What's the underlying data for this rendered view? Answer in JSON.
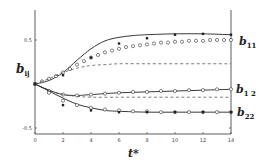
{
  "chart_data": {
    "type": "line",
    "title": "",
    "xlabel": "t*",
    "ylabel": "b_ij",
    "xlim": [
      0,
      14
    ],
    "ylim": [
      -0.6,
      0.75
    ],
    "xticks": [
      0,
      2,
      4,
      6,
      8,
      10,
      12,
      14
    ],
    "yticks": [
      -0.5,
      0.5
    ],
    "ytick_labels": [
      "-0.5",
      "0.5"
    ],
    "grid": false,
    "legend": "right-side curve labels",
    "curve_labels": [
      {
        "name": "b11",
        "text": "b",
        "sub": "11",
        "y_value": 0.5
      },
      {
        "name": "b12",
        "text": "b",
        "sub": "1 2",
        "y_value": -0.06
      },
      {
        "name": "b22",
        "text": "b",
        "sub": "22",
        "y_value": -0.32
      }
    ],
    "series": [
      {
        "name": "b11 solid",
        "style": "solid",
        "x": [
          0,
          1,
          2,
          3,
          4,
          5,
          6,
          7,
          8,
          10,
          12,
          14
        ],
        "values": [
          0,
          0.04,
          0.13,
          0.27,
          0.4,
          0.49,
          0.53,
          0.55,
          0.56,
          0.57,
          0.57,
          0.56
        ]
      },
      {
        "name": "b11 circles",
        "style": "circles",
        "x": [
          0,
          0.5,
          1,
          1.5,
          2,
          2.5,
          3,
          3.5,
          4,
          4.5,
          5,
          5.5,
          6,
          6.5,
          7,
          7.5,
          8,
          8.5,
          9,
          9.5,
          10,
          10.5,
          11,
          11.5,
          12,
          12.5,
          13,
          13.5,
          14
        ],
        "values": [
          0,
          0.03,
          0.06,
          0.09,
          0.13,
          0.17,
          0.22,
          0.26,
          0.3,
          0.33,
          0.36,
          0.38,
          0.4,
          0.42,
          0.43,
          0.44,
          0.45,
          0.46,
          0.47,
          0.47,
          0.48,
          0.48,
          0.49,
          0.49,
          0.49,
          0.5,
          0.5,
          0.5,
          0.5
        ]
      },
      {
        "name": "b11 squares",
        "style": "squares",
        "x": [
          0,
          2,
          4,
          6,
          8,
          10,
          12,
          14
        ],
        "values": [
          0,
          0.1,
          0.3,
          0.46,
          0.52,
          0.56,
          0.57,
          0.56
        ]
      },
      {
        "name": "b11 dashed",
        "style": "dashed",
        "x": [
          0,
          1,
          2,
          3,
          4,
          5,
          6,
          8,
          10,
          12,
          14
        ],
        "values": [
          0,
          0.06,
          0.13,
          0.18,
          0.21,
          0.22,
          0.23,
          0.23,
          0.23,
          0.23,
          0.23
        ]
      },
      {
        "name": "b12 solid",
        "style": "solid",
        "x": [
          0,
          1,
          2,
          3,
          4,
          6,
          8,
          10,
          12,
          14
        ],
        "values": [
          0,
          -0.07,
          -0.12,
          -0.13,
          -0.12,
          -0.1,
          -0.09,
          -0.08,
          -0.07,
          -0.06
        ]
      },
      {
        "name": "b12 circles",
        "style": "circles",
        "x": [
          0,
          1,
          2,
          3,
          4,
          5,
          6,
          7,
          8,
          9,
          10,
          11,
          12,
          13,
          14
        ],
        "values": [
          0,
          -0.08,
          -0.12,
          -0.13,
          -0.12,
          -0.11,
          -0.1,
          -0.09,
          -0.09,
          -0.08,
          -0.08,
          -0.07,
          -0.07,
          -0.06,
          -0.06
        ]
      },
      {
        "name": "b12 dashed",
        "style": "dashed",
        "x": [
          0,
          1,
          2,
          3,
          4,
          6,
          8,
          10,
          12,
          14
        ],
        "values": [
          0,
          -0.07,
          -0.12,
          -0.14,
          -0.15,
          -0.15,
          -0.15,
          -0.15,
          -0.15,
          -0.15
        ]
      },
      {
        "name": "b22 solid",
        "style": "solid",
        "x": [
          0,
          1,
          2,
          3,
          4,
          5,
          6,
          8,
          10,
          12,
          14
        ],
        "values": [
          0,
          -0.08,
          -0.16,
          -0.23,
          -0.27,
          -0.3,
          -0.31,
          -0.32,
          -0.32,
          -0.32,
          -0.32
        ]
      },
      {
        "name": "b22 circles",
        "style": "circles",
        "x": [
          0,
          1,
          2,
          3,
          4,
          5,
          6,
          7,
          8,
          9,
          10,
          11,
          12,
          13,
          14
        ],
        "values": [
          0,
          -0.1,
          -0.19,
          -0.24,
          -0.27,
          -0.29,
          -0.3,
          -0.31,
          -0.31,
          -0.32,
          -0.32,
          -0.32,
          -0.32,
          -0.32,
          -0.32
        ]
      },
      {
        "name": "b22 squares",
        "style": "squares",
        "x": [
          0,
          2,
          4,
          6,
          8,
          10,
          12,
          14
        ],
        "values": [
          0,
          -0.24,
          -0.3,
          -0.32,
          -0.32,
          -0.32,
          -0.32,
          -0.32
        ]
      }
    ]
  },
  "labels": {
    "y_axis": "b",
    "y_axis_sub": "ij",
    "x_axis": "t*",
    "b11": "b",
    "b11_sub": "11",
    "b12": "b",
    "b12_sub": "1 2",
    "b22": "b",
    "b22_sub": "22"
  }
}
